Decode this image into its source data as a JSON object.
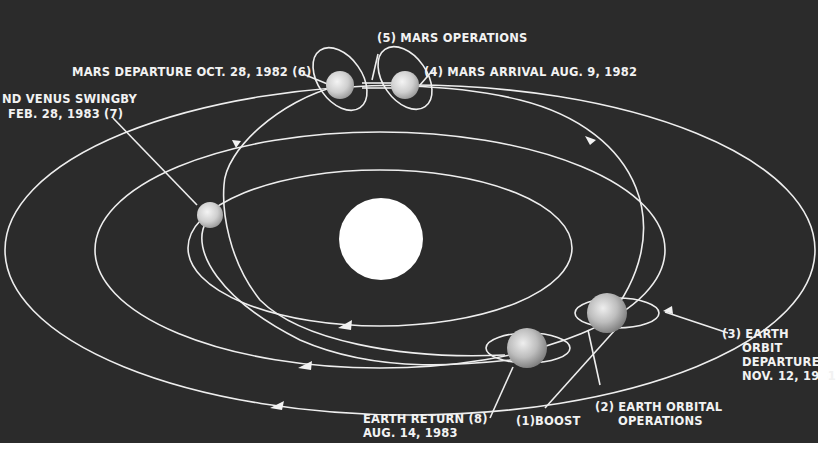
{
  "diagram": {
    "type": "mission-trajectory",
    "colors": {
      "background": "#2b2b2b",
      "line": "#eeeeee",
      "sun": "#ffffff",
      "planet": "#d8d8d8",
      "border": "#ffffff"
    },
    "bodies": {
      "sun": "Sun",
      "mars_departure_planet": "Mars",
      "mars_arrival_planet": "Mars",
      "venus": "Venus",
      "earth_departure": "Earth",
      "earth_return": "Earth"
    },
    "labels": {
      "mars_operations": "(5) MARS  OPERATIONS",
      "mars_departure": "MARS DEPARTURE OCT. 28, 1982 (6)",
      "mars_arrival": "(4) MARS  ARRIVAL  AUG. 9, 1982",
      "venus_swingby_line1": "ND VENUS SWINGBY",
      "venus_swingby_line2": "FEB. 28, 1983  (7)",
      "earth_orbit_departure_line1": "(3) EARTH",
      "earth_orbit_departure_line2": "ORBIT",
      "earth_orbit_departure_line3": "DEPARTURE",
      "earth_orbit_departure_line4": "NOV. 12, 1981",
      "earth_return_line1": "EARTH  RETURN (8)",
      "earth_return_line2": "AUG. 14, 1983",
      "boost": "(1)BOOST",
      "earth_orbital_ops_line1": "(2)  EARTH  ORBITAL",
      "earth_orbital_ops_line2": "OPERATIONS"
    }
  }
}
